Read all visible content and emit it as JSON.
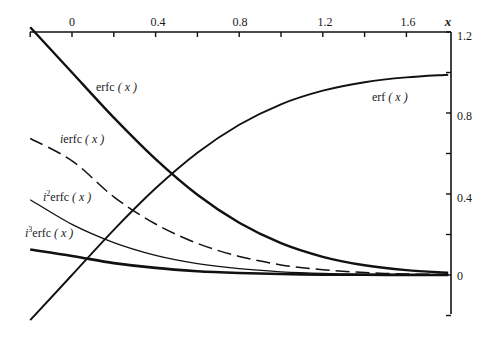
{
  "chart_data": {
    "type": "line",
    "title": "",
    "xlabel": "x",
    "ylabel": "",
    "xlim": [
      -0.22,
      1.8
    ],
    "ylim": [
      -0.22,
      1.2
    ],
    "grid": false,
    "legend": "inline labels",
    "x_ticks": [
      {
        "value": -0.2,
        "label": ""
      },
      {
        "value": 0,
        "label": "0"
      },
      {
        "value": 0.2,
        "label": ""
      },
      {
        "value": 0.4,
        "label": "0.4"
      },
      {
        "value": 0.6,
        "label": ""
      },
      {
        "value": 0.8,
        "label": "0.8"
      },
      {
        "value": 1.0,
        "label": ""
      },
      {
        "value": 1.2,
        "label": "1.2"
      },
      {
        "value": 1.4,
        "label": ""
      },
      {
        "value": 1.6,
        "label": "1.6"
      }
    ],
    "y_ticks": [
      {
        "value": 1.2,
        "label": "1.2"
      },
      {
        "value": 1.0,
        "label": ""
      },
      {
        "value": 0.8,
        "label": "0.8"
      },
      {
        "value": 0.6,
        "label": ""
      },
      {
        "value": 0.4,
        "label": "0.4"
      },
      {
        "value": 0.2,
        "label": ""
      },
      {
        "value": 0,
        "label": "0"
      },
      {
        "value": -0.2,
        "label": ""
      }
    ],
    "x": [
      -0.2,
      0,
      0.2,
      0.4,
      0.6,
      0.8,
      1.0,
      1.2,
      1.4,
      1.6,
      1.8
    ],
    "series": [
      {
        "name": "erf(x)",
        "style": "solid-thick",
        "values": [
          -0.223,
          0,
          0.223,
          0.428,
          0.604,
          0.742,
          0.843,
          0.91,
          0.952,
          0.976,
          0.989
        ]
      },
      {
        "name": "erfc(x)",
        "style": "solid-thick",
        "values": [
          1.223,
          1.0,
          0.777,
          0.572,
          0.396,
          0.258,
          0.157,
          0.09,
          0.048,
          0.024,
          0.011
        ]
      },
      {
        "name": "ierfc(x)",
        "style": "dashed",
        "values": [
          0.674,
          0.564,
          0.386,
          0.252,
          0.156,
          0.092,
          0.05,
          0.026,
          0.012,
          0.005,
          0.002
        ]
      },
      {
        "name": "i²erfc(x)",
        "style": "solid-thin",
        "values": [
          0.372,
          0.25,
          0.16,
          0.097,
          0.056,
          0.031,
          0.016,
          0.008,
          0.004,
          0.002,
          0.001
        ]
      },
      {
        "name": "i³erfc(x)",
        "style": "solid-thick",
        "values": [
          0.126,
          0.094,
          0.059,
          0.035,
          0.019,
          0.01,
          0.005,
          0.002,
          0.001,
          0.0005,
          0.0002
        ]
      }
    ],
    "annotations": [
      {
        "text": "erfc ( x )",
        "near": "erfc(x)"
      },
      {
        "text": "ierfc ( x )",
        "near": "ierfc(x)"
      },
      {
        "text": "i2erfc ( x )",
        "near": "i²erfc(x)"
      },
      {
        "text": "i3erfc ( x )",
        "near": "i³erfc(x)"
      },
      {
        "text": "erf ( x )",
        "near": "erf(x)"
      }
    ]
  },
  "labels": {
    "x_axis_name": "x",
    "x_tick_0": "0",
    "x_tick_04": "0.4",
    "x_tick_08": "0.8",
    "x_tick_12": "1.2",
    "x_tick_16": "1.6",
    "y_tick_12": "1.2",
    "y_tick_08": "0.8",
    "y_tick_04": "0.4",
    "y_tick_0": "0",
    "erfc": {
      "prefix": "",
      "sup": "",
      "fn": "erfc",
      "arg": " ( x )"
    },
    "ierfc": {
      "prefix": "i",
      "sup": "",
      "fn": "erfc",
      "arg": " ( x )"
    },
    "i2erfc": {
      "prefix": "i",
      "sup": "2",
      "fn": "erfc",
      "arg": " ( x )"
    },
    "i3erfc": {
      "prefix": "i",
      "sup": "3",
      "fn": "erfc",
      "arg": " ( x )"
    },
    "erf": {
      "prefix": "",
      "sup": "",
      "fn": "erf",
      "arg": " ( x )"
    }
  }
}
